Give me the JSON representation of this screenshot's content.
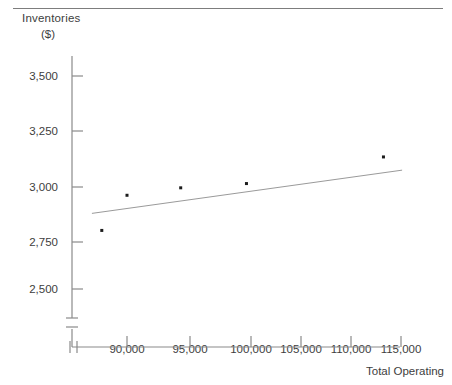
{
  "chart_data": {
    "type": "scatter",
    "title": "",
    "ylabel": "Inventories",
    "ylabel_unit": "($)",
    "xlabel": "Total Operating",
    "x_ticks": [
      "90,000",
      "95,000",
      "100,000",
      "105,000",
      "110,000",
      "115,000"
    ],
    "x_tick_values": [
      90000,
      95000,
      100000,
      105000,
      110000,
      115000
    ],
    "y_ticks": [
      "2,500",
      "2,750",
      "3,000",
      "3,250",
      "3,500"
    ],
    "y_tick_values": [
      2500,
      2750,
      3000,
      3250,
      3500
    ],
    "xlim": [
      86000,
      117500
    ],
    "ylim": [
      2420,
      3570
    ],
    "grid": false,
    "legend": null,
    "axis_break_x": true,
    "axis_break_y": true,
    "points": [
      {
        "x": 87700,
        "y": 2775
      },
      {
        "x": 90000,
        "y": 2940
      },
      {
        "x": 94900,
        "y": 2975
      },
      {
        "x": 100900,
        "y": 2995
      },
      {
        "x": 113400,
        "y": 3120
      }
    ],
    "series": [
      {
        "name": "Inventories",
        "x": [
          87700,
          90000,
          94900,
          100900,
          113400
        ],
        "values": [
          2775,
          2940,
          2975,
          2995,
          3120
        ]
      }
    ],
    "trendline": {
      "type": "linear-fit",
      "x_start": 86800,
      "y_start": 2855,
      "x_end": 115100,
      "y_end": 3058
    },
    "colors": {
      "axis": "#8a8a8a",
      "point": "#1c1c1c",
      "trendline": "#9a9a9a",
      "text": "#3d3d3d",
      "rule": "#7d7d7d"
    }
  }
}
